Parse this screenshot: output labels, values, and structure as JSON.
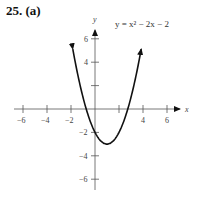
{
  "label": "25. (a)",
  "equation": "y = x² − 2x − 2",
  "chart_data": {
    "type": "line",
    "title": "25. (a)",
    "xlabel": "x",
    "ylabel": "y",
    "xlim": [
      -7,
      7
    ],
    "ylim": [
      -7,
      7
    ],
    "xticks": [
      -6,
      -4,
      -2,
      2,
      4,
      6
    ],
    "xtick_labels": [
      "-6",
      "-4",
      "-2",
      "4",
      "6"
    ],
    "yticks": [
      -6,
      -4,
      -2,
      2,
      4,
      6
    ],
    "ytick_labels": [
      "6",
      "4",
      "-2",
      "-4",
      "-6"
    ],
    "grid": false,
    "series": [
      {
        "name": "y = x^2 - 2x - 2",
        "x": [
          -2,
          -1,
          0,
          1,
          2,
          3,
          4
        ],
        "y": [
          6,
          1,
          -2,
          -3,
          -2,
          1,
          6
        ]
      }
    ],
    "annotations": [
      "y = x² − 2x − 2"
    ]
  }
}
